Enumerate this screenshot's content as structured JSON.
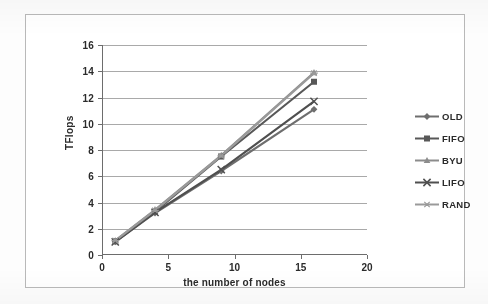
{
  "chart_data": {
    "type": "line",
    "title": "",
    "xlabel": "the number of nodes",
    "ylabel": "TFlops",
    "x": [
      1,
      4,
      9,
      16
    ],
    "xlim": [
      0,
      20
    ],
    "ylim": [
      0,
      16
    ],
    "xticks": [
      "0",
      "5",
      "10",
      "15",
      "20"
    ],
    "xtick_values": [
      0,
      5,
      10,
      15,
      20
    ],
    "yticks": [
      "0",
      "2",
      "4",
      "6",
      "8",
      "10",
      "12",
      "14",
      "16"
    ],
    "ytick_values": [
      0,
      2,
      4,
      6,
      8,
      10,
      12,
      14,
      16
    ],
    "grid": "horizontal",
    "legend_position": "right",
    "series": [
      {
        "name": "OLD",
        "marker": "diamond",
        "color": "#6e6e6e",
        "values": [
          1.0,
          3.2,
          6.4,
          11.1
        ]
      },
      {
        "name": "FIFO",
        "marker": "square",
        "color": "#585858",
        "values": [
          1.05,
          3.3,
          7.5,
          13.2
        ]
      },
      {
        "name": "BYU",
        "marker": "triangle",
        "color": "#8c8c8c",
        "values": [
          1.1,
          3.45,
          7.6,
          13.9
        ]
      },
      {
        "name": "LIFO",
        "marker": "cross",
        "color": "#4f4f4f",
        "values": [
          1.0,
          3.25,
          6.5,
          11.7
        ]
      },
      {
        "name": "RAND",
        "marker": "asterisk",
        "color": "#9a9a9a",
        "values": [
          1.1,
          3.4,
          7.55,
          13.85
        ]
      }
    ]
  },
  "legend": {
    "items": [
      {
        "label": "OLD"
      },
      {
        "label": "FIFO"
      },
      {
        "label": "BYU"
      },
      {
        "label": "LIFO"
      },
      {
        "label": "RAND"
      }
    ]
  },
  "axes": {
    "y_title": "TFlops",
    "x_title": "the number of nodes"
  },
  "colors": {
    "grid": "#9a9a9a",
    "axis": "#6d6d6d",
    "text": "#2b2b2b",
    "frame": "#b9b9b9",
    "background": "#ffffff"
  }
}
